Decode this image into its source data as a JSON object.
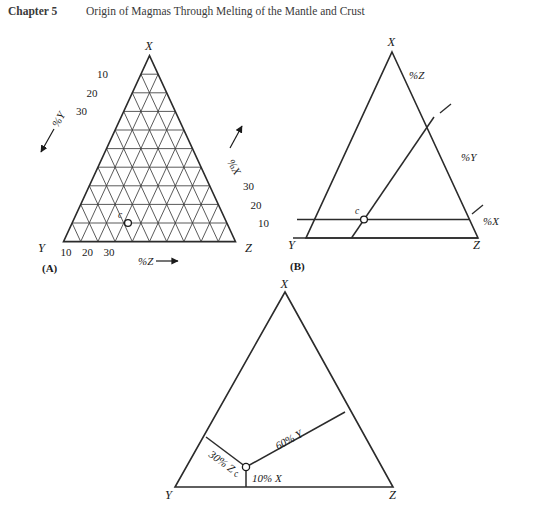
{
  "header": {
    "chapter": "Chapter 5",
    "title": "Origin of Magmas Through Melting of the Mantle and Crust"
  },
  "figure": {
    "panels": [
      {
        "caption": "(A)",
        "type": "ternary-grid",
        "apex_label": "X",
        "left_label": "Y",
        "right_label": "Z",
        "grid_divisions": 10,
        "left_ticks": [
          "10",
          "20",
          "30"
        ],
        "right_ticks": [
          "30",
          "20",
          "10"
        ],
        "bottom_ticks": [
          "10",
          "20",
          "30"
        ],
        "axis_labels": {
          "x": "%X",
          "y": "%Y",
          "z": "%Z"
        },
        "point": {
          "label": "c",
          "x_pct": 10,
          "y_pct": 60,
          "z_pct": 30
        }
      },
      {
        "caption": "(B)",
        "type": "ternary-construction",
        "apex_label": "X",
        "left_label": "Y",
        "right_label": "Z",
        "axis_labels": {
          "x": "%X",
          "y": "%Y",
          "z": "%Z"
        },
        "point": {
          "label": "c",
          "x_pct": 10,
          "y_pct": 60,
          "z_pct": 30
        }
      },
      {
        "caption": "",
        "type": "ternary-result",
        "apex_label": "X",
        "left_label": "Y",
        "right_label": "Z",
        "value_labels": {
          "z": "30% Z",
          "y": "60% Y",
          "x": "10% X"
        },
        "point": {
          "label": "c",
          "x_pct": 10,
          "y_pct": 60,
          "z_pct": 30
        }
      }
    ]
  },
  "chart_data": {
    "type": "scatter",
    "xlabel": "%Z",
    "ylabel": "%X",
    "grid": true,
    "legend_position": "none",
    "axes": [
      {
        "name": "X",
        "vertex": "top",
        "range": [
          0,
          100
        ],
        "tick_step": 10,
        "labeled_ticks": [
          10,
          20,
          30
        ]
      },
      {
        "name": "Y",
        "vertex": "bottom-left",
        "range": [
          0,
          100
        ],
        "tick_step": 10,
        "labeled_ticks": [
          10,
          20,
          30
        ]
      },
      {
        "name": "Z",
        "vertex": "bottom-right",
        "range": [
          0,
          100
        ],
        "tick_step": 10,
        "labeled_ticks": [
          10,
          20,
          30
        ]
      }
    ],
    "series": [
      {
        "name": "c",
        "points": [
          {
            "label": "c",
            "X": 10,
            "Y": 60,
            "Z": 30
          }
        ]
      }
    ],
    "annotations": [
      "30% Z",
      "60% Y",
      "10% X",
      "%X",
      "%Y",
      "%Z"
    ]
  }
}
